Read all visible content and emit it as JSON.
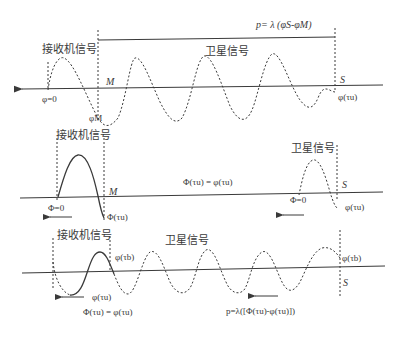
{
  "panel1": {
    "formula": "p= λ (φS-φM)",
    "receiver_label": "接收机信号",
    "satellite_label": "卫星信号",
    "point_m": "M",
    "point_s": "S",
    "phi_zero": "φ=0",
    "phi_m": "φM",
    "phi_tau_u": "φ(τu)"
  },
  "panel2": {
    "receiver_label": "接收机信号",
    "satellite_label": "卫星信号",
    "point_m": "M",
    "point_s": "S",
    "phi_zero_left": "Φ=0",
    "phi_zero_right": "Φ=0",
    "Phi_tau_u": "Φ(τu)",
    "phi_tau_u": "φ(τu)",
    "equation": "Φ(τu) = φ(τu)"
  },
  "panel3": {
    "receiver_label": "接收机信号",
    "satellite_label": "卫星信号",
    "point_s": "S",
    "phi_tau_b_left": "φ(τb)",
    "phi_tau_b_right": "φ(τb)",
    "phi_tau_u": "φ(τu)",
    "equation": "Φ(τu) = φ(τu)",
    "range_formula": "p=λ([Φ(τu)-φ(τu)])"
  },
  "colors": {
    "line": "#3a3a3a",
    "background": "#ffffff"
  }
}
